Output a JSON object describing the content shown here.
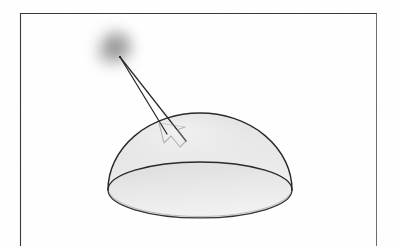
{
  "figure": {
    "kind": "scanned-diagram",
    "title": "Hemisphere lit by a diffuse light source",
    "background_color": "#ffffff",
    "width": 398,
    "height": 246
  },
  "frame": {
    "name": "page-border",
    "stroke_color": "#3a3a3a",
    "stroke_width": 1.1,
    "left": 20,
    "top": 13,
    "right": 377,
    "bottom": 246,
    "has_bottom_edge": false,
    "note": "thin rectangular rule; bottom edge runs off the cropped page"
  },
  "dome": {
    "name": "hemisphere",
    "label": "hemisphere",
    "apex_x": 200,
    "apex_y": 113,
    "base_center_x": 200,
    "base_center_y": 190,
    "base_radius_x": 92,
    "base_radius_y": 28,
    "left_edge_x": 108,
    "right_edge_x": 292,
    "base_bottom_y": 218,
    "outline_color": "#2e2e2e",
    "outline_width": 1.3,
    "fill_top_color": "#e8e8e8",
    "fill_bottom_color": "#c9c9c9",
    "base_fill_top_color": "#dedede",
    "base_fill_bottom_color": "#efefef",
    "seam_color": "#333333"
  },
  "light_source": {
    "name": "light-source-blob",
    "label": "diffuse light source",
    "center_x": 115,
    "center_y": 48,
    "radius": 30,
    "core_color": "#7a7a7a",
    "mid_color": "#b8b8b8",
    "edge_color": "#ffffff",
    "blur_px": 9
  },
  "rays": {
    "name": "incident-rays",
    "origin_x": 120,
    "origin_y": 57,
    "stroke_color": "#2a2a2a",
    "stroke_width": 1.2,
    "lines": [
      {
        "name": "ray-inner",
        "x1": 120,
        "y1": 57,
        "x2": 167,
        "y2": 134
      },
      {
        "name": "ray-outer",
        "x1": 120,
        "y1": 57,
        "x2": 186,
        "y2": 141
      }
    ]
  },
  "arrow": {
    "name": "incidence-arrowhead",
    "stroke_color": "#8f9198",
    "stroke_width": 1.1,
    "fill": "none",
    "tip_x": 179,
    "tip_y": 146,
    "points": "159,123 164,143 171,136 180,147 186,141 177,130 185,127"
  },
  "colors": {
    "paper": "#ffffff",
    "ink": "#2e2e2e",
    "dome_light": "#e8e8e8",
    "dome_dark": "#c9c9c9",
    "blob_core": "#7a7a7a",
    "arrow_gray": "#8f9198"
  }
}
